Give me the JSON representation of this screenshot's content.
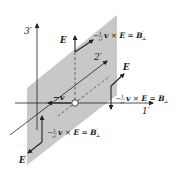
{
  "diagram": {
    "colors": {
      "plane": "#c8c8c8",
      "line": "#222222",
      "background": "#ffffff"
    },
    "axes": {
      "x_label": "1′",
      "y_label": "2′",
      "z_label": "3′"
    },
    "origin_vector": {
      "label": "−v"
    },
    "vectors": {
      "field_label": "E",
      "cross_label_prefix": "−",
      "cross_label_frac_num": "1",
      "cross_label_frac_den": "c²",
      "cross_label_v": "v",
      "cross_label_times": " × ",
      "cross_label_E": "E",
      "cross_label_eq": " = ",
      "cross_label_B": "B",
      "cross_label_B_sup": "′",
      "cross_label_B_sub": "⊥"
    },
    "annotations": [
      {
        "id": "top",
        "E": "E",
        "B": "−(1/c²) v × E = B′⊥"
      },
      {
        "id": "right",
        "E": "E",
        "B": "−(1/c²) v × E = B′⊥"
      },
      {
        "id": "bottom-left",
        "E": "E",
        "B": "−(1/c²) v × E = B′⊥"
      }
    ]
  }
}
